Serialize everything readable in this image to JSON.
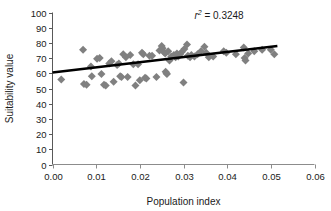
{
  "chart_data": {
    "type": "scatter",
    "title": "",
    "xlabel": "Population index",
    "ylabel": "Suitability value",
    "xlim": [
      0.0,
      0.06
    ],
    "ylim": [
      0,
      100
    ],
    "xticks": [
      0.0,
      0.01,
      0.02,
      0.03,
      0.04,
      0.05,
      0.06
    ],
    "xtick_labels": [
      "0.00",
      "0.01",
      "0.02",
      "0.03",
      "0.04",
      "0.05",
      "0.06"
    ],
    "yticks": [
      0,
      10,
      20,
      30,
      40,
      50,
      60,
      70,
      80,
      90,
      100
    ],
    "ytick_labels": [
      "0",
      "10",
      "20",
      "30",
      "40",
      "50",
      "60",
      "70",
      "80",
      "90",
      "100"
    ],
    "grid": false,
    "legend": false,
    "marker": {
      "shape": "diamond",
      "color": "#808080",
      "size": 4
    },
    "annotations": [
      {
        "name": "r-squared-label",
        "text": "r² = 0.3248",
        "text_parts": {
          "symbol": "r",
          "exponent": "2",
          "equals": " = 0.3248"
        },
        "x": 0.0325,
        "y": 96
      }
    ],
    "trendline": {
      "name": "linear-trendline",
      "color": "#000000",
      "width": 2.6,
      "x_start": 0.0,
      "y_start": 60.5,
      "x_end": 0.0515,
      "y_end": 78.0,
      "r_squared": 0.3248
    },
    "series": [
      {
        "name": "suitability-vs-population",
        "points": [
          [
            0.002,
            56.0
          ],
          [
            0.007,
            75.5
          ],
          [
            0.0072,
            53.0
          ],
          [
            0.0078,
            52.5
          ],
          [
            0.0088,
            64.5
          ],
          [
            0.009,
            58.0
          ],
          [
            0.0102,
            69.5
          ],
          [
            0.0108,
            70.0
          ],
          [
            0.0112,
            59.5
          ],
          [
            0.0118,
            52.5
          ],
          [
            0.0122,
            52.0
          ],
          [
            0.013,
            66.5
          ],
          [
            0.0135,
            68.0
          ],
          [
            0.014,
            54.5
          ],
          [
            0.0148,
            65.5
          ],
          [
            0.0152,
            66.5
          ],
          [
            0.0155,
            58.0
          ],
          [
            0.0158,
            57.5
          ],
          [
            0.0162,
            72.5
          ],
          [
            0.0168,
            70.5
          ],
          [
            0.0172,
            57.5
          ],
          [
            0.0178,
            72.0
          ],
          [
            0.0185,
            66.0
          ],
          [
            0.019,
            52.0
          ],
          [
            0.0196,
            66.0
          ],
          [
            0.02,
            55.5
          ],
          [
            0.0205,
            73.5
          ],
          [
            0.0208,
            72.5
          ],
          [
            0.0212,
            57.0
          ],
          [
            0.0215,
            56.5
          ],
          [
            0.0222,
            71.5
          ],
          [
            0.0228,
            71.5
          ],
          [
            0.0238,
            57.5
          ],
          [
            0.0245,
            75.0
          ],
          [
            0.025,
            78.0
          ],
          [
            0.0252,
            76.5
          ],
          [
            0.0255,
            74.0
          ],
          [
            0.0258,
            73.0
          ],
          [
            0.0259,
            61.0
          ],
          [
            0.0261,
            60.0
          ],
          [
            0.0262,
            59.5
          ],
          [
            0.0265,
            74.5
          ],
          [
            0.0268,
            68.5
          ],
          [
            0.0272,
            71.0
          ],
          [
            0.0278,
            72.0
          ],
          [
            0.0282,
            70.5
          ],
          [
            0.0285,
            73.0
          ],
          [
            0.0288,
            71.0
          ],
          [
            0.0292,
            72.5
          ],
          [
            0.0296,
            74.0
          ],
          [
            0.03,
            54.0
          ],
          [
            0.0302,
            76.0
          ],
          [
            0.0308,
            79.0
          ],
          [
            0.031,
            71.5
          ],
          [
            0.0315,
            70.5
          ],
          [
            0.0318,
            72.0
          ],
          [
            0.0325,
            71.0
          ],
          [
            0.0332,
            72.5
          ],
          [
            0.034,
            74.5
          ],
          [
            0.0348,
            77.5
          ],
          [
            0.0352,
            73.5
          ],
          [
            0.0358,
            70.5
          ],
          [
            0.0368,
            71.0
          ],
          [
            0.0392,
            74.5
          ],
          [
            0.0398,
            73.5
          ],
          [
            0.042,
            72.5
          ],
          [
            0.0438,
            77.0
          ],
          [
            0.044,
            70.0
          ],
          [
            0.0442,
            68.5
          ],
          [
            0.0448,
            73.0
          ],
          [
            0.0462,
            74.5
          ],
          [
            0.048,
            75.5
          ],
          [
            0.05,
            75.5
          ],
          [
            0.0508,
            72.5
          ]
        ]
      }
    ]
  },
  "axes": {
    "y_axis_name": "y-axis",
    "x_axis_name": "x-axis"
  }
}
